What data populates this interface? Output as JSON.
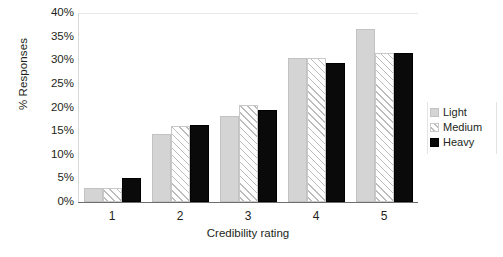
{
  "chart_data": {
    "type": "bar",
    "title": "",
    "subtitle": "",
    "xlabel": "Credibility rating",
    "ylabel": "% Responses",
    "categories": [
      "1",
      "2",
      "3",
      "4",
      "5"
    ],
    "series": [
      {
        "name": "Light",
        "values": [
          3.0,
          14.5,
          18.3,
          30.5,
          36.7
        ]
      },
      {
        "name": "Medium",
        "values": [
          3.0,
          16.0,
          20.5,
          30.5,
          31.5
        ]
      },
      {
        "name": "Heavy",
        "values": [
          5.0,
          16.3,
          19.4,
          29.5,
          31.5
        ]
      }
    ],
    "ylim": [
      0,
      40
    ],
    "ytick_values": [
      0,
      5,
      10,
      15,
      20,
      25,
      30,
      35,
      40
    ],
    "ytick_labels": [
      "0%",
      "5%",
      "10%",
      "15%",
      "20%",
      "25%",
      "30%",
      "35%",
      "40%"
    ],
    "grid": false,
    "legend_position": "right",
    "colors": {
      "light": "#d4d4d4",
      "medium": "#ffffff",
      "heavy": "#0a0a0a",
      "axis": "#6e6e6e",
      "text": "#231f20"
    }
  }
}
